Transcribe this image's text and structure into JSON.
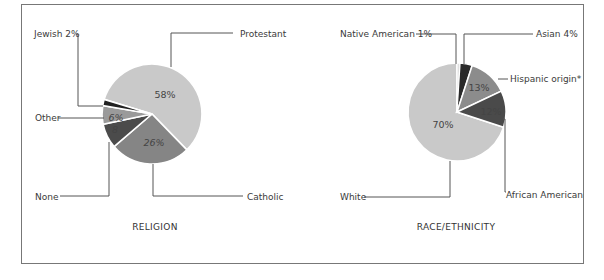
{
  "chart_data": [
    {
      "type": "pie",
      "title": "RELIGION",
      "slices": [
        {
          "label": "Protestant",
          "value": 58,
          "display": "58%",
          "color": "#c9c9c9"
        },
        {
          "label": "Catholic",
          "value": 26,
          "display": "26%",
          "color": "#858585"
        },
        {
          "label": "None",
          "value": 8,
          "display": "8",
          "color": "#4b4b4b"
        },
        {
          "label": "Other",
          "value": 6,
          "display": "6%",
          "color": "#9a9a9a"
        },
        {
          "label": "Jewish",
          "value": 2,
          "display": "Jewish 2%",
          "color": "#222222"
        }
      ]
    },
    {
      "type": "pie",
      "title": "RACE/ETHNICITY",
      "slices": [
        {
          "label": "Native American",
          "value": 1,
          "display": "Native American 1%",
          "color": "#e0e0e0"
        },
        {
          "label": "Asian",
          "value": 4,
          "display": "Asian 4%",
          "color": "#2a2a2a"
        },
        {
          "label": "Hispanic origin*",
          "value": 13,
          "display": "13%",
          "color": "#8c8c8c"
        },
        {
          "label": "African American",
          "value": 12,
          "display": "12%",
          "color": "#4a4a4a"
        },
        {
          "label": "White",
          "value": 70,
          "display": "70%",
          "color": "#c9c9c9"
        }
      ]
    }
  ],
  "religion": {
    "title": "RELIGION",
    "labels": {
      "protestant": "Protestant",
      "catholic": "Catholic",
      "none": "None",
      "other": "Other",
      "jewish": "Jewish 2%"
    },
    "pcts": {
      "protestant": "58%",
      "catholic": "26%",
      "none": "8",
      "other": "6%"
    }
  },
  "race": {
    "title": "RACE/ETHNICITY",
    "labels": {
      "native": "Native American 1%",
      "asian": "Asian 4%",
      "hispanic": "Hispanic origin*",
      "african": "African American",
      "white": "White"
    },
    "pcts": {
      "hispanic": "13%",
      "african": "12%",
      "white": "70%"
    }
  }
}
